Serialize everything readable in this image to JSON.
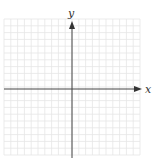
{
  "diagram": {
    "type": "coordinate-plane",
    "x_axis_label": "x",
    "y_axis_label": "y",
    "grid": {
      "columns": 20,
      "rows": 20,
      "left": 4,
      "top": 19,
      "cell": 6.8,
      "line_color": "#e6e6e6"
    },
    "axes": {
      "color": "#444444",
      "origin_x": 72,
      "origin_y": 89
    }
  }
}
